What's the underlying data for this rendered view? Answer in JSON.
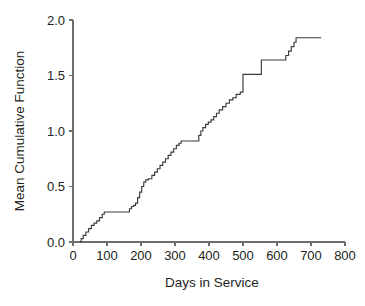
{
  "chart_data": {
    "type": "line",
    "subtype": "step",
    "title": "",
    "xlabel": "Days in Service",
    "ylabel": "Mean Cumulative Function",
    "xlim": [
      0,
      800
    ],
    "ylim": [
      0.0,
      2.0
    ],
    "xticks": [
      0,
      100,
      200,
      300,
      400,
      500,
      600,
      700,
      800
    ],
    "xticklabels": [
      "0",
      "100",
      "200",
      "300",
      "400",
      "500",
      "600",
      "700",
      "800"
    ],
    "yticks": [
      0.0,
      0.5,
      1.0,
      1.5,
      2.0
    ],
    "yticklabels": [
      "0.0",
      "0.5",
      "1.0",
      "1.5",
      "2.0"
    ],
    "grid": false,
    "legend": null,
    "line_color": "#3b3b3d",
    "axis_color": "#6d6e71",
    "series": [
      {
        "name": "Mean Cumulative Function",
        "step": "post",
        "x": [
          20,
          24,
          30,
          38,
          46,
          54,
          62,
          70,
          78,
          86,
          92,
          160,
          166,
          172,
          178,
          184,
          190,
          196,
          202,
          208,
          214,
          222,
          232,
          240,
          248,
          256,
          264,
          272,
          280,
          288,
          296,
          304,
          312,
          318,
          364,
          370,
          376,
          382,
          390,
          398,
          406,
          414,
          422,
          430,
          440,
          450,
          460,
          470,
          480,
          492,
          500,
          548,
          554,
          618,
          626,
          634,
          642,
          650,
          656,
          730
        ],
        "y": [
          0.0,
          0.03,
          0.06,
          0.09,
          0.12,
          0.15,
          0.17,
          0.19,
          0.22,
          0.25,
          0.27,
          0.27,
          0.3,
          0.32,
          0.33,
          0.35,
          0.4,
          0.45,
          0.5,
          0.54,
          0.56,
          0.57,
          0.6,
          0.63,
          0.66,
          0.69,
          0.72,
          0.75,
          0.78,
          0.81,
          0.84,
          0.87,
          0.89,
          0.91,
          0.91,
          0.96,
          1.0,
          1.03,
          1.06,
          1.08,
          1.1,
          1.13,
          1.16,
          1.19,
          1.22,
          1.25,
          1.28,
          1.3,
          1.33,
          1.35,
          1.51,
          1.51,
          1.64,
          1.64,
          1.68,
          1.72,
          1.76,
          1.8,
          1.84,
          1.84
        ]
      }
    ]
  }
}
